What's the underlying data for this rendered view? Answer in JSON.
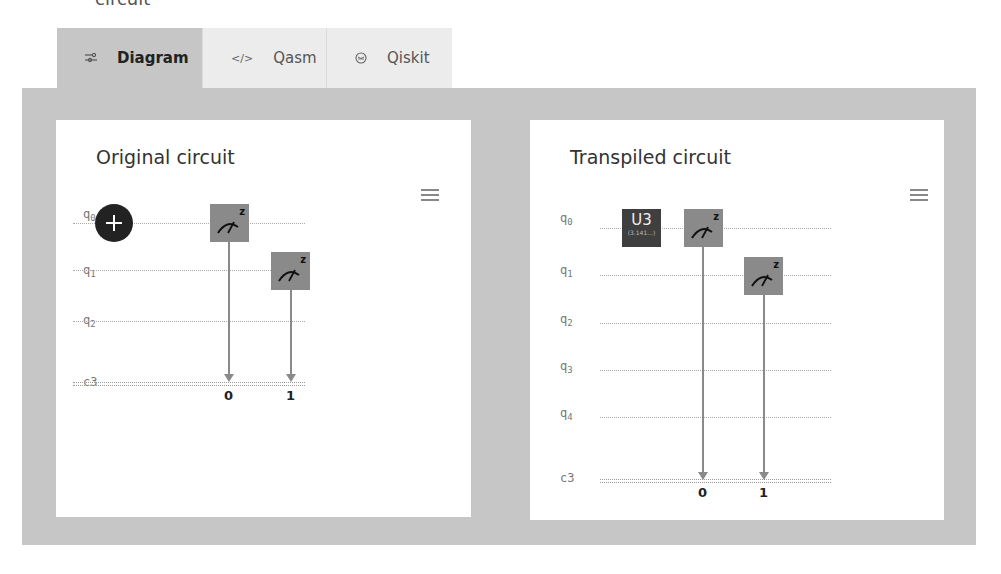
{
  "page": {
    "cut_heading": "circuit"
  },
  "tabs": [
    {
      "label": "Diagram",
      "icon": "diagram-icon",
      "active": true
    },
    {
      "label": "Qasm",
      "icon": "code-icon",
      "active": false
    },
    {
      "label": "Qiskit",
      "icon": "qiskit-icon",
      "active": false
    }
  ],
  "colors": {
    "stage_bg": "#c6c6c6",
    "tab_active_bg": "#c6c6c6",
    "tab_inactive_bg": "#ececec",
    "panel_bg": "#ffffff",
    "x_gate": "#222222",
    "measure_gate": "#8a8a8a",
    "u3_gate": "#3f3f3f"
  },
  "original": {
    "title": "Original circuit",
    "qubits": [
      "q",
      "q",
      "q"
    ],
    "qubit_indices": [
      "0",
      "1",
      "2"
    ],
    "classical": "c3",
    "gates": [
      {
        "type": "X",
        "qubit": 0
      },
      {
        "type": "measure",
        "qubit": 0,
        "basis": "z",
        "bit": "0"
      },
      {
        "type": "measure",
        "qubit": 1,
        "basis": "z",
        "bit": "1"
      }
    ],
    "bit_labels": [
      "0",
      "1"
    ],
    "measure_basis": "z"
  },
  "transpiled": {
    "title": "Transpiled circuit",
    "qubits": [
      "q",
      "q",
      "q",
      "q",
      "q"
    ],
    "qubit_indices": [
      "0",
      "1",
      "2",
      "3",
      "4"
    ],
    "classical": "c3",
    "gates": [
      {
        "type": "U3",
        "qubit": 0,
        "param": "(3.141...)"
      },
      {
        "type": "measure",
        "qubit": 0,
        "basis": "z",
        "bit": "0"
      },
      {
        "type": "measure",
        "qubit": 1,
        "basis": "z",
        "bit": "1"
      }
    ],
    "u3_name": "U3",
    "u3_param": "(3.141...)",
    "bit_labels": [
      "0",
      "1"
    ],
    "measure_basis": "z"
  }
}
